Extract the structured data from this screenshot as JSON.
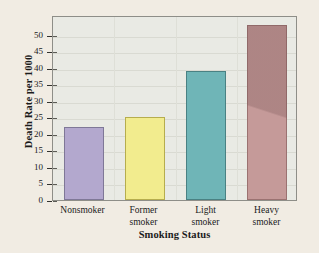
{
  "chart_data": {
    "type": "bar",
    "title": "",
    "xlabel": "Smoking Status",
    "ylabel": "Death Rate per 1000",
    "categories": [
      "Nonsmoker",
      "Former smoker",
      "Light smoker",
      "Heavy smoker"
    ],
    "category_lines": [
      [
        "Nonsmoker"
      ],
      [
        "Former",
        "smoker"
      ],
      [
        "Light",
        "smoker"
      ],
      [
        "Heavy",
        "smoker"
      ]
    ],
    "values": [
      22,
      25,
      39,
      53
    ],
    "bar_colors": [
      "#b3a8ce",
      "#f2ec8e",
      "#6fb5b7",
      "#c59a99"
    ],
    "bar_edge_colors": [
      "#7f7897",
      "#b6ad4e",
      "#4a8183",
      "#9b7271"
    ],
    "ylim": [
      0,
      56
    ],
    "yticks": [
      0,
      5,
      10,
      15,
      20,
      25,
      30,
      35,
      40,
      45,
      50
    ],
    "ytick_labels": [
      "0",
      "5",
      "10",
      "15",
      "20",
      "25",
      "30",
      "35",
      "40",
      "45",
      "50"
    ],
    "grid": true,
    "legend": "none",
    "plot_background": "#e9eae4",
    "figure_background": "#f1ece3"
  }
}
